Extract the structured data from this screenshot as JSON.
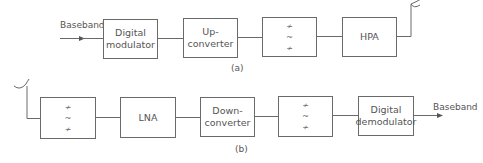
{
  "diagram": {
    "part_a": {
      "caption": "(a)",
      "input_label": "Baseband",
      "blocks": [
        {
          "id": "digital-modulator",
          "label": "Digital\nmodulator"
        },
        {
          "id": "up-converter",
          "label": "Up-\nconverter"
        },
        {
          "id": "filter",
          "label": "",
          "symbols": [
            "≁",
            "~",
            "≁"
          ]
        },
        {
          "id": "hpa",
          "label": "HPA"
        }
      ],
      "output": "antenna"
    },
    "part_b": {
      "caption": "(b)",
      "input": "antenna",
      "blocks": [
        {
          "id": "filter",
          "label": "",
          "symbols": [
            "≁",
            "~",
            "≁"
          ]
        },
        {
          "id": "lna",
          "label": "LNA"
        },
        {
          "id": "down-converter",
          "label": "Down-\nconverter"
        },
        {
          "id": "filter-2",
          "label": "",
          "symbols": [
            "≁",
            "~",
            "≁"
          ]
        },
        {
          "id": "digital-demodulator",
          "label": "Digital\ndemodulator"
        }
      ],
      "output_label": "Baseband"
    },
    "colors": {
      "line": "#6a6a6a",
      "text": "#555555"
    }
  }
}
